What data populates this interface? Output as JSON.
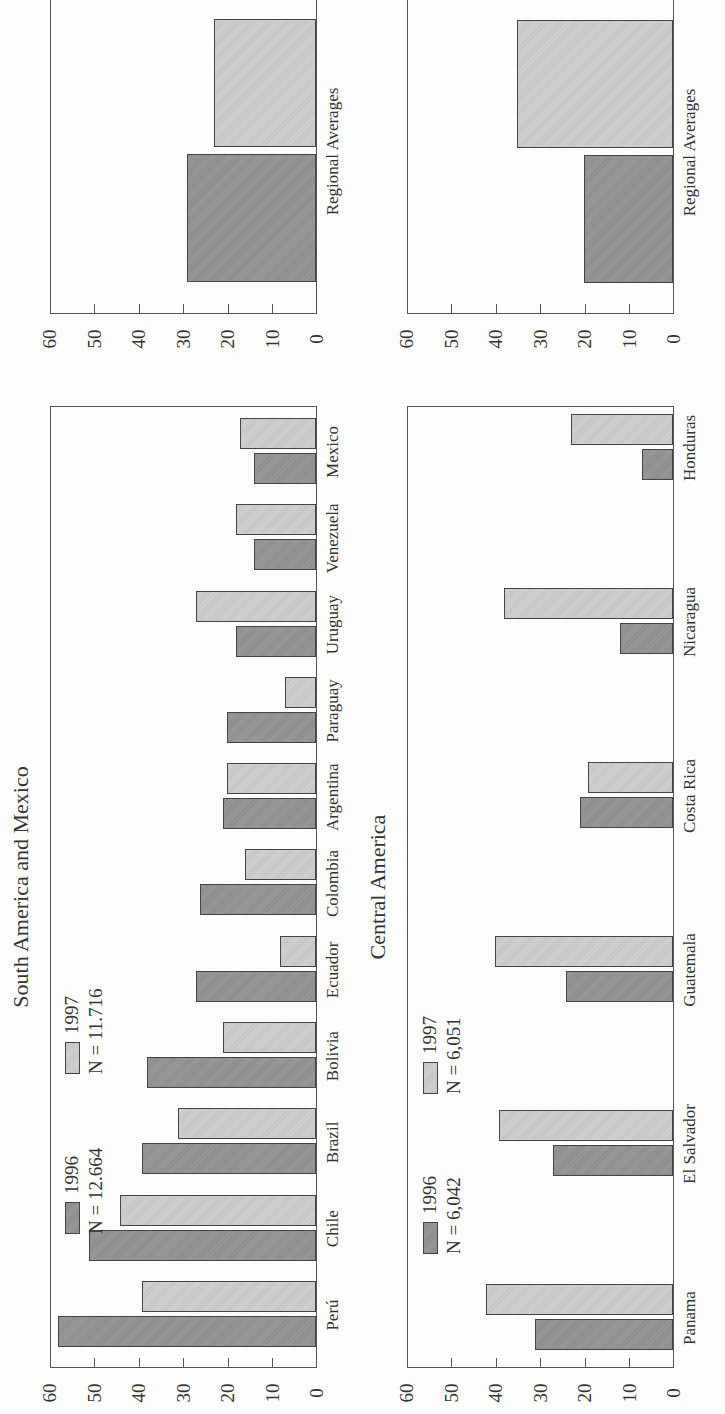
{
  "chart_data": [
    {
      "type": "bar",
      "title": "South America and Mexico",
      "categories": [
        "Perú",
        "Chile",
        "Brazil",
        "Bolivia",
        "Ecuador",
        "Colombia",
        "Argentina",
        "Paraguay",
        "Uruguay",
        "Venezuela",
        "Mexico"
      ],
      "series": [
        {
          "name": "1996",
          "n_label": "N = 12.664",
          "values": [
            58,
            51,
            39,
            38,
            27,
            26,
            21,
            20,
            18,
            14,
            14
          ]
        },
        {
          "name": "1997",
          "n_label": "N = 11.716",
          "values": [
            39,
            44,
            31,
            21,
            8,
            16,
            20,
            7,
            27,
            18,
            17
          ]
        }
      ],
      "ylim": [
        0,
        60
      ],
      "yticks": [
        "0",
        "10",
        "20",
        "30",
        "40",
        "50",
        "60"
      ],
      "orientation": "rotated 90° counterclockwise"
    },
    {
      "type": "bar",
      "title": "",
      "categories": [
        "Regional Averages"
      ],
      "series": [
        {
          "name": "1996",
          "values": [
            29
          ]
        },
        {
          "name": "1997",
          "values": [
            23
          ]
        }
      ],
      "ylim": [
        0,
        60
      ],
      "yticks": [
        "0",
        "10",
        "20",
        "30",
        "40",
        "50",
        "60"
      ]
    },
    {
      "type": "bar",
      "title": "Central America",
      "categories": [
        "Panama",
        "El Salvador",
        "Guatemala",
        "Costa Rica",
        "Nicaragua",
        "Honduras"
      ],
      "series": [
        {
          "name": "1996",
          "n_label": "N = 6,042",
          "values": [
            31,
            27,
            24,
            21,
            12,
            7
          ]
        },
        {
          "name": "1997",
          "n_label": "N = 6,051",
          "values": [
            42,
            39,
            40,
            19,
            38,
            23
          ]
        }
      ],
      "ylim": [
        0,
        60
      ],
      "yticks": [
        "0",
        "10",
        "20",
        "30",
        "40",
        "50",
        "60"
      ]
    },
    {
      "type": "bar",
      "title": "",
      "categories": [
        "Regional Averages"
      ],
      "series": [
        {
          "name": "1996",
          "values": [
            20
          ]
        },
        {
          "name": "1997",
          "values": [
            35
          ]
        }
      ],
      "ylim": [
        0,
        60
      ],
      "yticks": [
        "0",
        "10",
        "20",
        "30",
        "40",
        "50",
        "60"
      ]
    }
  ],
  "colors": {
    "series_1996": "#939393",
    "series_1997": "#cbcbcb",
    "axis": "#555555"
  }
}
